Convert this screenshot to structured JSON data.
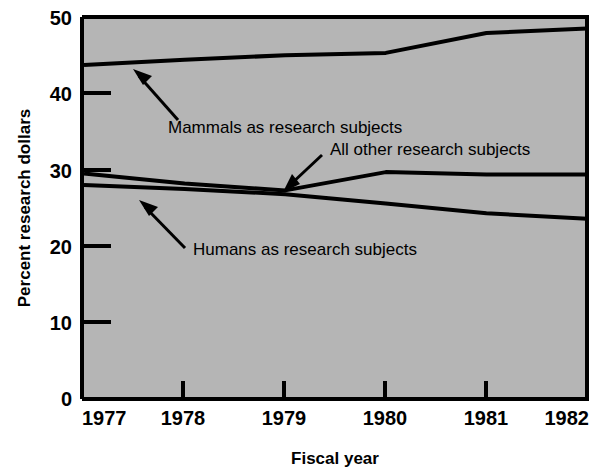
{
  "chart_data": {
    "type": "line",
    "title": "",
    "xlabel": "Fiscal year",
    "ylabel": "Percent research dollars",
    "x": [
      1977,
      1978,
      1979,
      1980,
      1981,
      1982
    ],
    "xlim": [
      1977,
      1982
    ],
    "ylim": [
      0,
      50
    ],
    "xticks": [
      "1977",
      "1978",
      "1979",
      "1980",
      "1981",
      "1982"
    ],
    "yticks": [
      "0",
      "10",
      "20",
      "30",
      "40",
      "50"
    ],
    "grid": false,
    "legend": "none (inline arrow annotations)",
    "series": [
      {
        "name": "Mammals as research subjects",
        "values": [
          43.7,
          44.4,
          45.0,
          45.3,
          47.9,
          48.5
        ]
      },
      {
        "name": "All other research subjects",
        "values": [
          29.5,
          28.2,
          27.3,
          29.7,
          29.4,
          29.4
        ]
      },
      {
        "name": "Humans as research subjects",
        "values": [
          28.0,
          27.5,
          26.8,
          25.6,
          24.3,
          23.6
        ]
      }
    ],
    "annotations": [
      {
        "text": "Mammals as research subjects",
        "target_series": "Mammals as research subjects",
        "arrow": "points up-left to the mammals line"
      },
      {
        "text": "All other research subjects",
        "target_series": "All other research subjects",
        "arrow": "points down-left to the all-other line"
      },
      {
        "text": "Humans as research subjects",
        "target_series": "Humans as research subjects",
        "arrow": "points up-left to the humans line"
      }
    ]
  },
  "style": {
    "plot_background": "#b5b5b5",
    "line_color": "#000000",
    "axis_color": "#000000",
    "page_background": "#ffffff"
  },
  "axes": {
    "y_title": "Percent research dollars",
    "x_title": "Fiscal year",
    "y_tick_0": "0",
    "y_tick_10": "10",
    "y_tick_20": "20",
    "y_tick_30": "30",
    "y_tick_40": "40",
    "y_tick_50": "50",
    "x_tick_1977": "1977",
    "x_tick_1978": "1978",
    "x_tick_1979": "1979",
    "x_tick_1980": "1980",
    "x_tick_1981": "1981",
    "x_tick_1982": "1982"
  },
  "annotations": {
    "mammals": "Mammals as research subjects",
    "all_other": "All other research subjects",
    "humans": "Humans as research subjects"
  }
}
